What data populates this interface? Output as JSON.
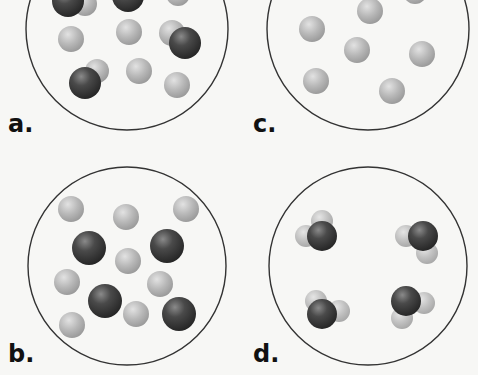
{
  "figure": {
    "colors": {
      "background": "#f7f7f5",
      "circle_stroke": "#333333",
      "light_atom": "#b5b5b5",
      "dark_atom": "#3e3e3e",
      "label": "#111111"
    },
    "panels": [
      {
        "id": "a",
        "label": "a.",
        "content": "mixture of single light atoms and diatomic dark-light molecules",
        "circle": {
          "cx": 127,
          "cy": 29,
          "r": 101
        },
        "label_pos": {
          "x": 8,
          "y": 112
        },
        "atoms": [
          {
            "type": "light",
            "cx": 85,
            "cy": 4,
            "r": 12
          },
          {
            "type": "dark",
            "cx": 68,
            "cy": 1,
            "r": 16
          },
          {
            "type": "dark",
            "cx": 128,
            "cy": -4,
            "r": 16
          },
          {
            "type": "light",
            "cx": 178,
            "cy": -6,
            "r": 12
          },
          {
            "type": "light",
            "cx": 71,
            "cy": 39,
            "r": 13
          },
          {
            "type": "light",
            "cx": 129,
            "cy": 32,
            "r": 13
          },
          {
            "type": "light",
            "cx": 172,
            "cy": 33,
            "r": 13
          },
          {
            "type": "dark",
            "cx": 185,
            "cy": 43,
            "r": 16
          },
          {
            "type": "light",
            "cx": 97,
            "cy": 71,
            "r": 12
          },
          {
            "type": "dark",
            "cx": 85,
            "cy": 83,
            "r": 16
          },
          {
            "type": "light",
            "cx": 139,
            "cy": 71,
            "r": 13
          },
          {
            "type": "light",
            "cx": 177,
            "cy": 85,
            "r": 13
          }
        ]
      },
      {
        "id": "c",
        "label": "c.",
        "content": "single light atoms only",
        "circle": {
          "cx": 368,
          "cy": 29,
          "r": 101
        },
        "label_pos": {
          "x": 253,
          "y": 112
        },
        "atoms": [
          {
            "type": "light",
            "cx": 370,
            "cy": 11,
            "r": 13
          },
          {
            "type": "light",
            "cx": 415,
            "cy": -8,
            "r": 12
          },
          {
            "type": "light",
            "cx": 312,
            "cy": 29,
            "r": 13
          },
          {
            "type": "light",
            "cx": 357,
            "cy": 50,
            "r": 13
          },
          {
            "type": "light",
            "cx": 422,
            "cy": 54,
            "r": 13
          },
          {
            "type": "light",
            "cx": 316,
            "cy": 81,
            "r": 13
          },
          {
            "type": "light",
            "cx": 392,
            "cy": 91,
            "r": 13
          }
        ]
      },
      {
        "id": "b",
        "label": "b.",
        "content": "mixture of separate light atoms and dark atoms",
        "circle": {
          "cx": 127,
          "cy": 266,
          "r": 99
        },
        "label_pos": {
          "x": 8,
          "y": 342
        },
        "atoms": [
          {
            "type": "light",
            "cx": 71,
            "cy": 209,
            "r": 13
          },
          {
            "type": "light",
            "cx": 126,
            "cy": 217,
            "r": 13
          },
          {
            "type": "light",
            "cx": 186,
            "cy": 209,
            "r": 13
          },
          {
            "type": "dark",
            "cx": 89,
            "cy": 248,
            "r": 17
          },
          {
            "type": "dark",
            "cx": 167,
            "cy": 246,
            "r": 17
          },
          {
            "type": "light",
            "cx": 128,
            "cy": 261,
            "r": 13
          },
          {
            "type": "light",
            "cx": 67,
            "cy": 282,
            "r": 13
          },
          {
            "type": "light",
            "cx": 160,
            "cy": 284,
            "r": 13
          },
          {
            "type": "dark",
            "cx": 105,
            "cy": 301,
            "r": 17
          },
          {
            "type": "light",
            "cx": 136,
            "cy": 314,
            "r": 13
          },
          {
            "type": "dark",
            "cx": 179,
            "cy": 314,
            "r": 17
          },
          {
            "type": "light",
            "cx": 72,
            "cy": 325,
            "r": 13
          }
        ]
      },
      {
        "id": "d",
        "label": "d.",
        "content": "triatomic molecules (one dark atom bonded to two light atoms)",
        "circle": {
          "cx": 368,
          "cy": 266,
          "r": 99
        },
        "label_pos": {
          "x": 253,
          "y": 342
        },
        "atoms": [
          {
            "type": "light",
            "cx": 322,
            "cy": 221,
            "r": 11
          },
          {
            "type": "light",
            "cx": 306,
            "cy": 236,
            "r": 11
          },
          {
            "type": "dark",
            "cx": 322,
            "cy": 236,
            "r": 15
          },
          {
            "type": "light",
            "cx": 406,
            "cy": 236,
            "r": 11
          },
          {
            "type": "light",
            "cx": 427,
            "cy": 253,
            "r": 11
          },
          {
            "type": "dark",
            "cx": 423,
            "cy": 236,
            "r": 15
          },
          {
            "type": "light",
            "cx": 316,
            "cy": 301,
            "r": 11
          },
          {
            "type": "light",
            "cx": 339,
            "cy": 311,
            "r": 11
          },
          {
            "type": "dark",
            "cx": 322,
            "cy": 314,
            "r": 15
          },
          {
            "type": "light",
            "cx": 424,
            "cy": 303,
            "r": 11
          },
          {
            "type": "light",
            "cx": 402,
            "cy": 318,
            "r": 11
          },
          {
            "type": "dark",
            "cx": 406,
            "cy": 301,
            "r": 15
          }
        ]
      }
    ]
  }
}
